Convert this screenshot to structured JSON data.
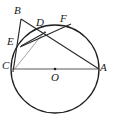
{
  "figure": {
    "type": "circle-geometry-diagram",
    "canvas": {
      "width": 115,
      "height": 120
    },
    "stroke_color": "#1f1f1f",
    "thin_stroke_color": "#8a8a8a",
    "background": "#ffffff",
    "circle": {
      "center_x": 55,
      "center_y": 69,
      "radius": 44,
      "center_dot_radius": 1.2,
      "stroke_width": 1.3
    },
    "points": {
      "A": {
        "x": 99,
        "y": 69,
        "label": "A",
        "label_x": 100,
        "label_y": 62
      },
      "B": {
        "x": 21,
        "y": 19,
        "label": "B",
        "label_x": 14,
        "label_y": 5
      },
      "C": {
        "x": 12,
        "y": 69,
        "label": "C",
        "label_x": 2,
        "label_y": 60
      },
      "D": {
        "x": 45,
        "y": 32,
        "label": "D",
        "label_x": 36,
        "label_y": 17
      },
      "E": {
        "x": 21,
        "y": 46,
        "label": "E",
        "label_x": 7,
        "label_y": 36
      },
      "F": {
        "x": 70,
        "y": 24,
        "label": "F",
        "label_x": 60,
        "label_y": 13
      },
      "O": {
        "x": 55,
        "y": 69,
        "label": "O",
        "label_x": 51,
        "label_y": 72
      }
    },
    "segments": [
      {
        "name": "tangent-BC",
        "from": "B",
        "to": "C",
        "style": "solid"
      },
      {
        "name": "diameter-CA",
        "from": "C",
        "to": "A",
        "style": "solid"
      },
      {
        "name": "chord-BA",
        "from": "B",
        "to": "A",
        "style": "solid"
      },
      {
        "name": "chord-CD",
        "from": "C",
        "to": "D",
        "style": "thin"
      },
      {
        "name": "segment-ED",
        "from": "E",
        "to": "D",
        "style": "solid"
      },
      {
        "name": "segment-CF",
        "from": "C",
        "to": "F",
        "style": "solid"
      }
    ],
    "labels_order": [
      "B",
      "D",
      "F",
      "E",
      "C",
      "O",
      "A"
    ]
  }
}
